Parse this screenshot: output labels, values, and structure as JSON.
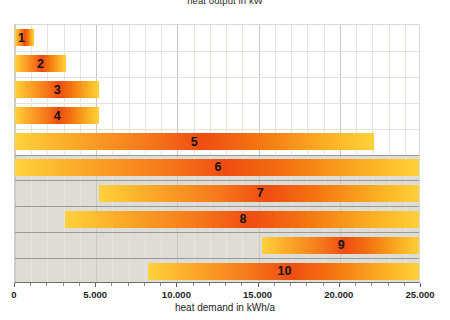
{
  "chart_data": {
    "type": "bar",
    "orientation": "horizontal",
    "title": "heat output in kW",
    "xlabel": "heat demand in kWh/a",
    "ylabel": "",
    "xlim": [
      0,
      25000
    ],
    "xticks": [
      0,
      5000,
      10000,
      15000,
      20000,
      25000
    ],
    "xticklabels": [
      "0",
      "5.000",
      "10.000",
      "15.000",
      "20.000",
      "25.000"
    ],
    "grid": true,
    "legend": "none",
    "categories": [
      "1",
      "2",
      "3",
      "4",
      "5",
      "6",
      "7",
      "8",
      "9",
      "10"
    ],
    "bars": [
      {
        "label": "1",
        "start": 0,
        "end": 1200
      },
      {
        "label": "2",
        "start": 0,
        "end": 3150
      },
      {
        "label": "3",
        "start": 0,
        "end": 5200
      },
      {
        "label": "4",
        "start": 0,
        "end": 5200
      },
      {
        "label": "5",
        "start": 0,
        "end": 22100
      },
      {
        "label": "6",
        "start": 0,
        "end": 25000
      },
      {
        "label": "7",
        "start": 5200,
        "end": 25000
      },
      {
        "label": "8",
        "start": 3100,
        "end": 25000
      },
      {
        "label": "9",
        "start": 15200,
        "end": 25000
      },
      {
        "label": "10",
        "start": 8200,
        "end": 25000
      }
    ],
    "colors": {
      "bar_gradient_edge": "#ffd23c",
      "bar_gradient_center": "#ef4d12",
      "plot_background_upper": "#ffffff",
      "plot_background_lower": "#dddcd6",
      "gridline_minor": "#e6e5e0",
      "gridline_major": "#c9c8c2",
      "axis": "#6d6d6a",
      "text": "#1e1e1e"
    }
  }
}
